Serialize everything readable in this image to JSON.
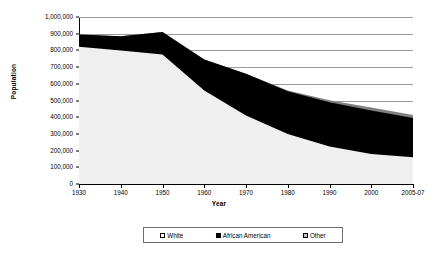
{
  "chart_data": {
    "type": "area",
    "stacked": true,
    "title": "",
    "xlabel": "Year",
    "ylabel": "Population",
    "grid": true,
    "legend_position": "bottom",
    "categories": [
      "1930",
      "1940",
      "1950",
      "1960",
      "1970",
      "1980",
      "1990",
      "2000",
      "2005-07"
    ],
    "x_tick_labels": [
      "1930",
      "1940",
      "1950",
      "1960",
      "1970",
      "1980",
      "1990",
      "2000",
      "2005-07"
    ],
    "y_tick_labels": [
      "0",
      "100,000",
      "200,000",
      "300,000",
      "400,000",
      "500,000",
      "600,000",
      "700,000",
      "800,000",
      "900,000",
      "1,000,000"
    ],
    "ylim": [
      0,
      1000000
    ],
    "ytick_step": 100000,
    "series": [
      {
        "name": "White",
        "color": "#efefef",
        "values": [
          822000,
          800000,
          775000,
          560000,
          410000,
          300000,
          225000,
          180000,
          160000
        ]
      },
      {
        "name": "African American",
        "color": "#000000",
        "values": [
          73000,
          85000,
          135000,
          185000,
          250000,
          255000,
          265000,
          260000,
          235000
        ]
      },
      {
        "name": "Other",
        "color": "#808080",
        "values": [
          0,
          0,
          0,
          0,
          0,
          5000,
          12000,
          18000,
          18000
        ]
      }
    ],
    "totals": [
      895000,
      885000,
      910000,
      745000,
      660000,
      560000,
      502000,
      458000,
      413000
    ],
    "legend_entries": [
      {
        "label": "White",
        "swatch": "#ffffff"
      },
      {
        "label": "African American",
        "swatch": "#000000"
      },
      {
        "label": "Other",
        "swatch": "#c0c0c0"
      }
    ]
  }
}
